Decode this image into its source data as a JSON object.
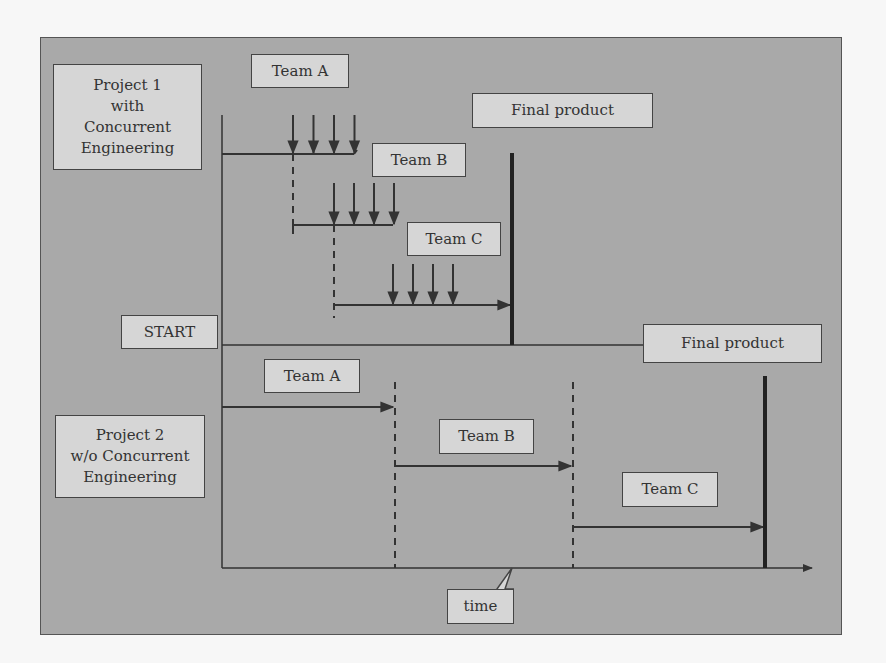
{
  "project1": {
    "title_lines": [
      "Project 1",
      "with",
      "Concurrent",
      "Engineering"
    ],
    "teams": [
      "Team A",
      "Team B",
      "Team C"
    ],
    "final_product": "Final product",
    "arrows_per_team": 4
  },
  "start_label": "START",
  "project2": {
    "title_lines": [
      "Project 2",
      "w/o Concurrent",
      "Engineering"
    ],
    "teams": [
      "Team A",
      "Team B",
      "Team C"
    ],
    "final_product": "Final product"
  },
  "axis": {
    "time_label": "time"
  },
  "colors": {
    "background": "#a9a9a9",
    "box_fill": "#d6d6d6",
    "line": "#333333"
  }
}
